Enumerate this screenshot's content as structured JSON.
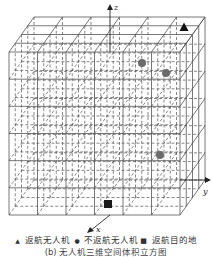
{
  "figure": {
    "axes": {
      "x_label": "x",
      "y_label": "y",
      "z_label": "z"
    },
    "grid": {
      "cols": 6,
      "rows": 6,
      "depth": 4
    },
    "markers": [
      {
        "type": "triangle",
        "role": "returning-drone",
        "x": 184,
        "y": 27
      },
      {
        "type": "circle",
        "role": "non-returning-drone",
        "x": 142,
        "y": 63
      },
      {
        "type": "circle",
        "role": "non-returning-drone",
        "x": 166,
        "y": 73
      },
      {
        "type": "circle",
        "role": "non-returning-drone",
        "x": 160,
        "y": 155
      },
      {
        "type": "square",
        "role": "return-destination",
        "x": 108,
        "y": 204
      }
    ],
    "colors": {
      "line": "#555555",
      "dash": "#555555",
      "circle": "#6b6b6b",
      "triangle": "#111111",
      "square": "#1a1a1a"
    }
  },
  "legend": {
    "triangle_symbol": "▲",
    "triangle_label": "返航无人机",
    "circle_symbol": "●",
    "circle_label": "不返航无人机",
    "square_symbol": "■",
    "square_label": "返航目的地"
  },
  "caption": "(b) 无人机三维空间体积立方图"
}
